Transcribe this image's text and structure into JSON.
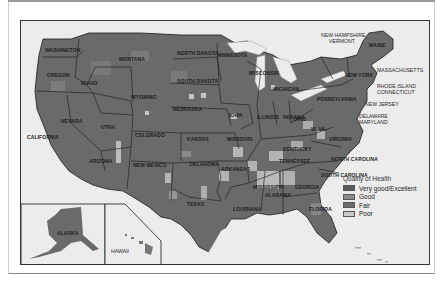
{
  "map": {
    "title": "Quality of Health by County, United States",
    "state_labels": {
      "washington": "WASHINGTON",
      "oregon": "OREGON",
      "california": "CALIFORNIA",
      "idaho": "IDAHO",
      "nevada": "NEVADA",
      "montana": "MONTANA",
      "wyoming": "WYOMING",
      "utah": "UTAH",
      "colorado": "COLORADO",
      "arizona": "ARIZONA",
      "new_mexico": "NEW MEXICO",
      "north_dakota": "NORTH DAKOTA",
      "south_dakota": "SOUTH DAKOTA",
      "nebraska": "NEBRASKA",
      "kansas": "KANSAS",
      "oklahoma": "OKLAHOMA",
      "texas": "TEXAS",
      "minnesota": "MINNESOTA",
      "iowa": "IOWA",
      "missouri": "MISSOURI",
      "arkansas": "ARKANSAS",
      "louisiana": "LOUISIANA",
      "wisconsin": "WISCONSIN",
      "illinois": "ILLINOIS",
      "michigan": "MICHIGAN",
      "indiana": "INDIANA",
      "ohio": "OHIO",
      "kentucky": "KENTUCKY",
      "tennessee": "TENNESSEE",
      "mississippi": "MISSISSIPPI",
      "alabama": "ALABAMA",
      "georgia": "GEORGIA",
      "florida": "FLORIDA",
      "south_carolina": "SOUTH CAROLINA",
      "north_carolina": "NORTH CAROLINA",
      "virginia": "VIRGINIA",
      "west_virginia": "W. VA.",
      "pennsylvania": "PENNSYLVANIA",
      "new_york": "NEW YORK",
      "maine": "MAINE",
      "alaska": "ALASKA",
      "hawaii": "HAWAII"
    },
    "callout_labels": {
      "nh_vt": "NEW HAMPSHIRE",
      "vt": "VERMONT",
      "massachusetts": "MASSACHUSETTS",
      "rhode_island": "RHODE ISLAND",
      "connecticut": "CONNECTICUT",
      "new_jersey": "NEW JERSEY",
      "delaware": "DELAWARE",
      "maryland": "MARYLAND"
    }
  },
  "legend": {
    "title": "Quality of Health",
    "items": [
      {
        "label": "Very good/Excellent",
        "color": "#5a5a5a"
      },
      {
        "label": "Good",
        "color": "#8a8a8a"
      },
      {
        "label": "Fair",
        "color": "#6e6e6e"
      },
      {
        "label": "Poor",
        "color": "#c8c8c8"
      }
    ]
  },
  "colors": {
    "land_dark": "#5f5f5f",
    "land_mid": "#7a7a7a",
    "land_light": "#8f8f8f",
    "poor": "#c6c6c6",
    "water": "#ececec",
    "border": "#1a1a1a"
  }
}
